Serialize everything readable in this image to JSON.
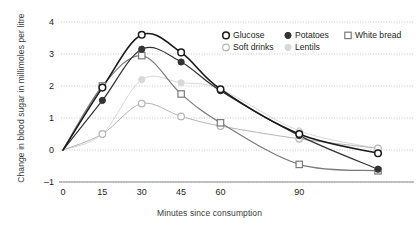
{
  "chart_data": {
    "type": "line",
    "title": "",
    "xlabel": "Minutes since consumption",
    "ylabel": "Change in blood sugar in millimoles per litre",
    "xlim": [
      0,
      120
    ],
    "ylim": [
      -1,
      4
    ],
    "xticks": [
      0,
      15,
      30,
      45,
      60,
      90
    ],
    "xtick_labels": [
      "0",
      "15",
      "30",
      "45",
      "60",
      "90"
    ],
    "yticks": [
      -1,
      0,
      1,
      2,
      3,
      4
    ],
    "ytick_labels": [
      "-1",
      "0",
      "1",
      "2",
      "3",
      "4"
    ],
    "grid": "horizontal-dotted",
    "legend_position": "top-right",
    "x": [
      0,
      15,
      30,
      45,
      60,
      90,
      120
    ],
    "series": [
      {
        "name": "Glucose",
        "marker": "open-circle",
        "color": "#1a1a1a",
        "values": [
          0,
          1.95,
          3.6,
          3.05,
          1.9,
          0.5,
          -0.1
        ]
      },
      {
        "name": "Potatoes",
        "marker": "filled-circle",
        "color": "#333333",
        "values": [
          0,
          1.55,
          3.15,
          2.75,
          1.85,
          0.45,
          -0.6
        ]
      },
      {
        "name": "White bread",
        "marker": "open-square",
        "color": "#7a7a7a",
        "values": [
          0,
          2.0,
          2.95,
          1.75,
          0.85,
          -0.45,
          -0.65
        ]
      },
      {
        "name": "Soft drinks",
        "marker": "open-circle-light",
        "color": "#b5b5b5",
        "values": [
          0,
          0.5,
          1.45,
          1.05,
          0.75,
          0.35,
          0.05
        ]
      },
      {
        "name": "Lentils",
        "marker": "filled-circle-light",
        "color": "#d8d8d8",
        "values": [
          0,
          0.5,
          2.2,
          2.1,
          1.9,
          0.6,
          0.05
        ]
      }
    ]
  },
  "legend": {
    "items": [
      {
        "label": "Glucose",
        "marker": "open-circle"
      },
      {
        "label": "Potatoes",
        "marker": "filled-circle"
      },
      {
        "label": "White bread",
        "marker": "open-square"
      },
      {
        "label": "Soft drinks",
        "marker": "open-circle-light"
      },
      {
        "label": "Lentils",
        "marker": "filled-circle-light"
      }
    ]
  }
}
